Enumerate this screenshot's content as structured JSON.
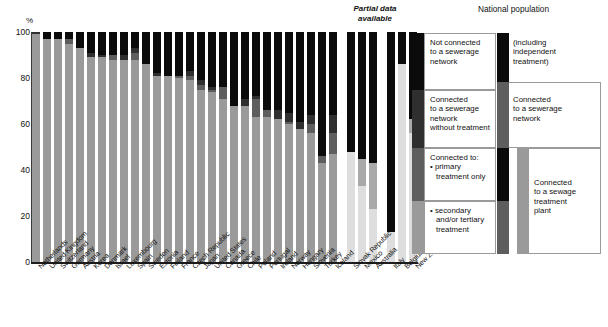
{
  "axis": {
    "y_unit": "%",
    "y_ticks": [
      "100",
      "80",
      "60",
      "40",
      "20",
      "0"
    ]
  },
  "annotations": {
    "partial_data": "Partial data\navailable",
    "partial_data_line1": "Partial data",
    "partial_data_line2": "available",
    "national_population": "National population"
  },
  "legend": {
    "items": [
      {
        "key": "not_connected",
        "label": "Not connected\nto a sewerage\nnetwork",
        "l1": "Not connected",
        "l2": "to a sewerage",
        "l3": "network",
        "color": "#0b0b0b"
      },
      {
        "key": "no_treatment",
        "label": "Connected\nto a sewerage\nnetwork\nwithout treatment",
        "l1": "Connected",
        "l2": "to a sewerage",
        "l3": "network",
        "l4": "without treatment",
        "color": "#2f2f2f"
      },
      {
        "key": "primary",
        "label": "Connected to:\n• primary\n   treatment only",
        "l1": "Connected to:",
        "l2": "primary",
        "l3": "treatment only",
        "color": "#5e5e5e"
      },
      {
        "key": "secondary",
        "label": "• secondary\n   and/or tertiary\n   treatment",
        "l2": "secondary",
        "l3": "and/or tertiary",
        "l4": "treatment",
        "color": "#9a9a9a"
      }
    ],
    "brackets": [
      {
        "key": "independent",
        "l1": "(including",
        "l2": "independent",
        "l3": "treatment)"
      },
      {
        "key": "sewerage_network",
        "l1": "Connected",
        "l2": "to a sewerage",
        "l3": "network"
      },
      {
        "key": "sewage_plant",
        "l1": "Connected",
        "l2": "to a sewage",
        "l3": "treatment",
        "l4": "plant"
      }
    ]
  },
  "chart_data": {
    "type": "bar",
    "stacked": true,
    "title": "",
    "xlabel": "",
    "ylabel": "%",
    "ylim": [
      0,
      100
    ],
    "grid": false,
    "legend_position": "right",
    "series_order": [
      "secondary_tertiary",
      "primary_only",
      "no_treatment",
      "not_connected"
    ],
    "series_colors": {
      "secondary_tertiary": "#9a9a9a",
      "primary_only": "#5e5e5e",
      "no_treatment": "#2f2f2f",
      "not_connected": "#0b0b0b"
    },
    "categories": [
      "Netherlands",
      "United Kingdom",
      "Switzerland",
      "Germany",
      "Austria",
      "Korea",
      "Denmark",
      "Israel",
      "Luxembourg",
      "Spain",
      "Sweden",
      "Estonia",
      "Finland",
      "France",
      "Czech Republic",
      "Japan",
      "United States",
      "Canada",
      "Greece",
      "Chile",
      "Poland",
      "Portugal",
      "Ireland",
      "Norway",
      "Hungary",
      "Slovenia",
      "Turkey",
      "Iceland",
      "Slovak Republic",
      "Mexico",
      "Australia",
      "Italy",
      "Belgium",
      "New Zealand"
    ],
    "partial_data_categories": [
      "Slovak Republic",
      "Mexico",
      "Australia",
      "Italy",
      "Belgium",
      "New Zealand"
    ],
    "series": [
      {
        "name": "secondary_tertiary",
        "values": [
          99,
          97,
          97,
          95,
          93,
          89,
          89,
          88,
          88,
          88,
          86,
          81,
          81,
          80,
          79,
          75,
          74,
          71,
          68,
          68,
          63,
          63,
          62,
          60,
          58,
          56,
          43,
          47,
          48,
          33,
          23,
          13,
          86,
          56
        ]
      },
      {
        "name": "primary_only",
        "values": [
          0,
          0,
          0,
          2,
          0,
          0,
          0,
          2,
          0,
          3,
          0,
          0,
          0,
          1,
          2,
          2,
          1,
          5,
          0,
          0,
          8,
          3,
          0,
          1,
          0,
          4,
          3,
          9,
          0,
          12,
          20,
          0,
          0,
          6
        ]
      },
      {
        "name": "no_treatment",
        "values": [
          1,
          0,
          0,
          0,
          0,
          2,
          1,
          0,
          2,
          2,
          0,
          1,
          0,
          0,
          2,
          2,
          1,
          0,
          0,
          3,
          1,
          0,
          4,
          4,
          3,
          4,
          0,
          8,
          0,
          0,
          0,
          0,
          0,
          0
        ]
      },
      {
        "name": "not_connected",
        "values": [
          0,
          3,
          3,
          3,
          7,
          9,
          10,
          10,
          10,
          7,
          14,
          18,
          19,
          19,
          17,
          21,
          24,
          24,
          32,
          29,
          28,
          34,
          34,
          35,
          39,
          36,
          54,
          36,
          52,
          55,
          57,
          87,
          14,
          38
        ]
      }
    ],
    "national_population_bars": [
      {
        "key": "not_connected_bar",
        "segments": [
          {
            "color": "#0b0b0b",
            "from": 64,
            "to": 100
          }
        ]
      },
      {
        "key": "sewerage_bar",
        "segments": [
          {
            "color": "#5e5e5e",
            "from": 0,
            "to": 64
          }
        ]
      },
      {
        "key": "treatment_plant_bar",
        "segments": [
          {
            "color": "#9a9a9a",
            "from": 0,
            "to": 85
          }
        ]
      }
    ]
  }
}
